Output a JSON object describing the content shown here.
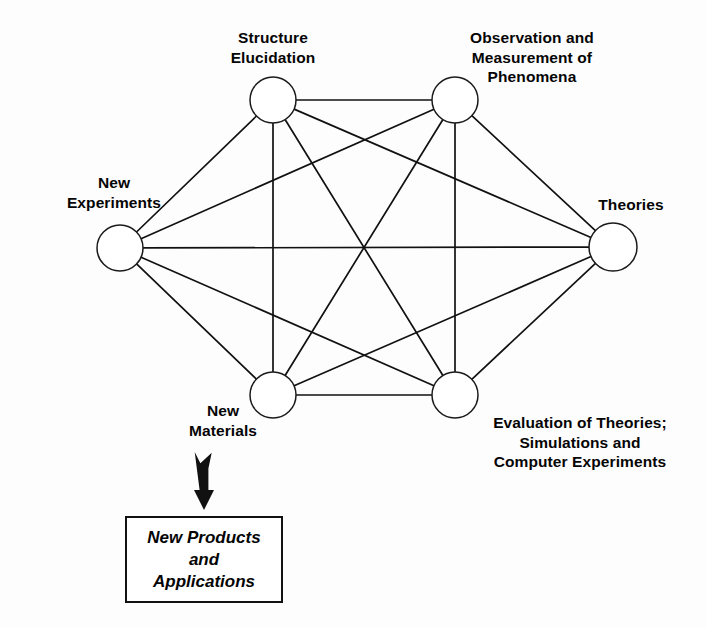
{
  "diagram": {
    "type": "complete-graph-k6",
    "background_color": "#fdfdfd",
    "line_color": "#111111",
    "node_fill": "#ffffff",
    "nodes": [
      {
        "id": "structure-elucidation",
        "label": "Structure\nElucidation",
        "lines": [
          "Structure",
          "Elucidation"
        ],
        "cx": 273,
        "cy": 100,
        "r": 23,
        "label_position": "above"
      },
      {
        "id": "observation-measurement",
        "label": "Observation and Measurement of Phenomena",
        "lines": [
          "Observation and",
          "Measurement of",
          "Phenomena"
        ],
        "cx": 455,
        "cy": 100,
        "r": 23,
        "label_position": "above-right"
      },
      {
        "id": "theories",
        "label": "Theories",
        "lines": [
          "Theories"
        ],
        "cx": 613,
        "cy": 247,
        "r": 24,
        "label_position": "above"
      },
      {
        "id": "evaluation-of-theories",
        "label": "Evaluation of Theories; Simulations and Computer Experiments",
        "lines": [
          "Evaluation of Theories;",
          "Simulations and",
          "Computer Experiments"
        ],
        "cx": 455,
        "cy": 395,
        "r": 23,
        "label_position": "below-right"
      },
      {
        "id": "new-materials",
        "label": "New Materials",
        "lines": [
          "New",
          "Materials"
        ],
        "cx": 273,
        "cy": 395,
        "r": 23,
        "label_position": "below-left"
      },
      {
        "id": "new-experiments",
        "label": "New Experiments",
        "lines": [
          "New",
          "Experiments"
        ],
        "cx": 120,
        "cy": 248,
        "r": 23,
        "label_position": "above-left"
      }
    ],
    "edges": [
      {
        "from": "structure-elucidation",
        "to": "observation-measurement"
      },
      {
        "from": "structure-elucidation",
        "to": "theories"
      },
      {
        "from": "structure-elucidation",
        "to": "evaluation-of-theories"
      },
      {
        "from": "structure-elucidation",
        "to": "new-materials"
      },
      {
        "from": "structure-elucidation",
        "to": "new-experiments"
      },
      {
        "from": "observation-measurement",
        "to": "theories"
      },
      {
        "from": "observation-measurement",
        "to": "evaluation-of-theories"
      },
      {
        "from": "observation-measurement",
        "to": "new-materials"
      },
      {
        "from": "observation-measurement",
        "to": "new-experiments"
      },
      {
        "from": "theories",
        "to": "evaluation-of-theories"
      },
      {
        "from": "theories",
        "to": "new-materials"
      },
      {
        "from": "theories",
        "to": "new-experiments"
      },
      {
        "from": "evaluation-of-theories",
        "to": "new-materials"
      },
      {
        "from": "evaluation-of-theories",
        "to": "new-experiments"
      },
      {
        "from": "new-materials",
        "to": "new-experiments"
      }
    ],
    "arrow": {
      "id": "outcome-arrow",
      "direction": "down",
      "from_node": "new-materials",
      "to": "outcome-box",
      "x": 204,
      "y_top": 452,
      "y_bottom": 510,
      "color": "#111111"
    },
    "outcome_box": {
      "id": "new-products-and-applications",
      "lines": [
        "New Products",
        "and",
        "Applications"
      ],
      "text": "New Products and Applications",
      "x": 125,
      "y": 516,
      "width": 158,
      "height": 87,
      "border_color": "#111111",
      "font_style": "bold-italic"
    }
  }
}
